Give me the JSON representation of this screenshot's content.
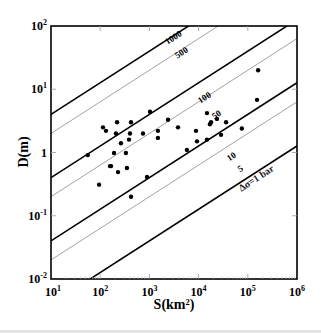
{
  "chart_data": {
    "type": "scatter",
    "title": "",
    "xlabel": "S(km²)",
    "ylabel": "D(m)",
    "xscale": "log",
    "yscale": "log",
    "xlim": [
      10,
      1000000
    ],
    "ylim": [
      0.01,
      100
    ],
    "x_ticks": [
      {
        "base": "10",
        "exp": "1"
      },
      {
        "base": "10",
        "exp": "2"
      },
      {
        "base": "10",
        "exp": "3"
      },
      {
        "base": "10",
        "exp": "4"
      },
      {
        "base": "10",
        "exp": "5"
      },
      {
        "base": "10",
        "exp": "6"
      }
    ],
    "y_ticks": [
      {
        "base": "10",
        "exp": "-2",
        "value": 0.01
      },
      {
        "base": "10",
        "exp": "-1",
        "value": 0.1
      },
      {
        "base": "1",
        "exp": "",
        "value": 1
      },
      {
        "base": "10",
        "exp": "1",
        "value": 10
      },
      {
        "base": "10",
        "exp": "2",
        "value": 100
      }
    ],
    "grid": false,
    "legend": null,
    "reference_lines": {
      "description": "Constant stress-drop lines, D proportional to S^0.5",
      "lines": [
        {
          "label": "1000",
          "stress_drop_bar": 1000,
          "style": "bold",
          "left_edge_D": 4.0
        },
        {
          "label": "500",
          "stress_drop_bar": 500,
          "style": "thin",
          "left_edge_D": 2.0
        },
        {
          "label": "100",
          "stress_drop_bar": 100,
          "style": "bold",
          "left_edge_D": 0.4
        },
        {
          "label": "50",
          "stress_drop_bar": 50,
          "style": "thin",
          "left_edge_D": 0.2
        },
        {
          "label": "10",
          "stress_drop_bar": 10,
          "style": "bold",
          "left_edge_D": 0.04
        },
        {
          "label": "5",
          "stress_drop_bar": 5,
          "style": "thin",
          "left_edge_D": 0.02
        },
        {
          "label": "Δσ=1 bar",
          "stress_drop_bar": 1,
          "style": "bold",
          "left_edge_D": 0.004
        }
      ]
    },
    "series": [
      {
        "name": "earthquakes",
        "marker": "filled-circle",
        "points": [
          {
            "S": 56,
            "D": 0.91
          },
          {
            "S": 95,
            "D": 0.31
          },
          {
            "S": 114,
            "D": 2.5
          },
          {
            "S": 131,
            "D": 2.2
          },
          {
            "S": 158,
            "D": 0.61
          },
          {
            "S": 166,
            "D": 0.61
          },
          {
            "S": 191,
            "D": 0.98
          },
          {
            "S": 220,
            "D": 3.0
          },
          {
            "S": 209,
            "D": 2.0
          },
          {
            "S": 230,
            "D": 0.49
          },
          {
            "S": 264,
            "D": 1.4
          },
          {
            "S": 333,
            "D": 0.98
          },
          {
            "S": 349,
            "D": 0.57
          },
          {
            "S": 385,
            "D": 1.6
          },
          {
            "S": 403,
            "D": 2.0
          },
          {
            "S": 423,
            "D": 3.0
          },
          {
            "S": 423,
            "D": 0.2
          },
          {
            "S": 742,
            "D": 2.0
          },
          {
            "S": 894,
            "D": 0.41
          },
          {
            "S": 1030,
            "D": 4.4
          },
          {
            "S": 1490,
            "D": 2.2
          },
          {
            "S": 1490,
            "D": 1.7
          },
          {
            "S": 2390,
            "D": 3.3
          },
          {
            "S": 3810,
            "D": 2.5
          },
          {
            "S": 5790,
            "D": 1.1
          },
          {
            "S": 8840,
            "D": 2.2
          },
          {
            "S": 9270,
            "D": 1.5
          },
          {
            "S": 14800,
            "D": 4.2
          },
          {
            "S": 14800,
            "D": 1.6
          },
          {
            "S": 17000,
            "D": 2.8
          },
          {
            "S": 17900,
            "D": 3.0
          },
          {
            "S": 23600,
            "D": 3.4
          },
          {
            "S": 28600,
            "D": 1.9
          },
          {
            "S": 36200,
            "D": 3.0
          },
          {
            "S": 75700,
            "D": 2.4
          },
          {
            "S": 154000,
            "D": 6.8
          },
          {
            "S": 162000,
            "D": 20
          }
        ]
      }
    ]
  }
}
